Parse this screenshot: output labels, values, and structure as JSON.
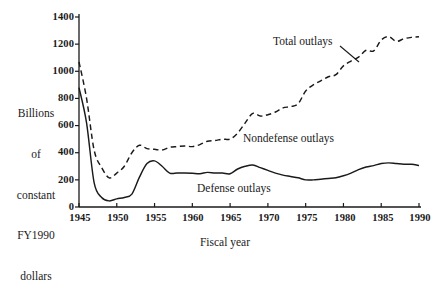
{
  "chart_data": {
    "type": "line",
    "title": "",
    "xlabel": "Fiscal year",
    "ylabel": "Billions of constant FY1990 dollars",
    "ylabel_lines": [
      "Billions",
      "of",
      "constant",
      "FY1990",
      "dollars"
    ],
    "xlim": [
      1945,
      1990
    ],
    "ylim": [
      0,
      1400
    ],
    "grid": false,
    "legend_position": "inline-annotations",
    "xticks": [
      1945,
      1950,
      1955,
      1960,
      1965,
      1970,
      1975,
      1980,
      1985,
      1990
    ],
    "xtick_labels": [
      "1945",
      "1950",
      "1955",
      "1960",
      "1965",
      "1970",
      "1975",
      "1980",
      "1985",
      "1990"
    ],
    "yticks": [
      0,
      200,
      400,
      600,
      800,
      1000,
      1200,
      1400
    ],
    "ytick_labels": [
      "0",
      "200",
      "400",
      "600",
      "800",
      "1000",
      "1200",
      "1400"
    ],
    "annotations": [
      {
        "name": "total-outlays-label",
        "text": "Total outlays",
        "x": 1976.5,
        "y": 1180
      },
      {
        "name": "nondefense-outlays-label",
        "text": "Nondefense outlays",
        "x": 1968.0,
        "y": 560
      },
      {
        "name": "defense-outlays-label",
        "text": "Defense outlays",
        "x": 1959.0,
        "y": 155
      }
    ],
    "x": [
      1945,
      1946,
      1947,
      1948,
      1949,
      1950,
      1951,
      1952,
      1953,
      1954,
      1955,
      1956,
      1957,
      1958,
      1959,
      1960,
      1961,
      1962,
      1963,
      1964,
      1965,
      1966,
      1967,
      1968,
      1969,
      1970,
      1971,
      1972,
      1973,
      1974,
      1975,
      1976,
      1977,
      1978,
      1979,
      1980,
      1981,
      1982,
      1983,
      1984,
      1985,
      1986,
      1987,
      1988,
      1989,
      1990
    ],
    "series": [
      {
        "name": "Total outlays",
        "style": "dashed",
        "color": "#1a1a1a",
        "values": [
          1070,
          800,
          420,
          290,
          215,
          250,
          300,
          400,
          455,
          430,
          425,
          420,
          440,
          445,
          450,
          445,
          460,
          485,
          490,
          500,
          500,
          545,
          620,
          690,
          670,
          680,
          700,
          730,
          740,
          760,
          855,
          900,
          930,
          960,
          975,
          1040,
          1075,
          1105,
          1155,
          1150,
          1230,
          1255,
          1220,
          1240,
          1250,
          1255
        ]
      },
      {
        "name": "Defense outlays",
        "style": "solid",
        "color": "#1a1a1a",
        "values": [
          880,
          620,
          180,
          70,
          45,
          60,
          70,
          95,
          220,
          320,
          340,
          300,
          250,
          250,
          250,
          248,
          245,
          255,
          250,
          250,
          245,
          280,
          300,
          310,
          290,
          270,
          250,
          235,
          225,
          215,
          200,
          200,
          205,
          210,
          215,
          230,
          250,
          275,
          295,
          305,
          320,
          325,
          320,
          315,
          315,
          305
        ]
      }
    ],
    "derived_series": [
      {
        "name": "Nondefense outlays",
        "note": "Area between the Total outlays and Defense outlays curves"
      }
    ]
  },
  "figure": {
    "background_color": "#ffffff",
    "axis_color": "#1a1a1a",
    "plot_area": {
      "left": 79,
      "right": 419,
      "top": 17,
      "bottom": 207
    }
  }
}
